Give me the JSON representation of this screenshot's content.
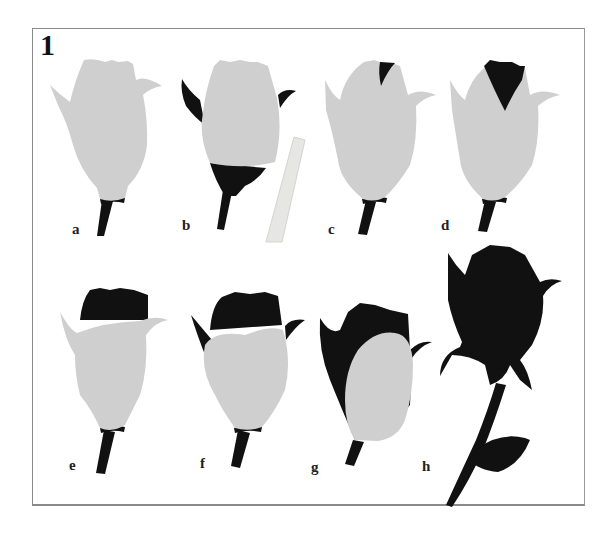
{
  "figure": {
    "number": "1",
    "colors": {
      "petal_light": "#cfcfcf",
      "petal_dark": "#111111",
      "frame": "#8a8a8a",
      "background": "#ffffff"
    },
    "steps": [
      {
        "label": "a",
        "description": "light bud with sepals"
      },
      {
        "label": "b",
        "description": "dark sepals and base, with rolled paper strip"
      },
      {
        "label": "c",
        "description": "small dark inner petal tip"
      },
      {
        "label": "d",
        "description": "larger dark inner petal"
      },
      {
        "label": "e",
        "description": "dark top petals, light wrap"
      },
      {
        "label": "f",
        "description": "dark sepals and top, light front"
      },
      {
        "label": "g",
        "description": "mostly dark with light front oval"
      },
      {
        "label": "h",
        "description": "finished dark rose with stem and leaf"
      }
    ]
  }
}
